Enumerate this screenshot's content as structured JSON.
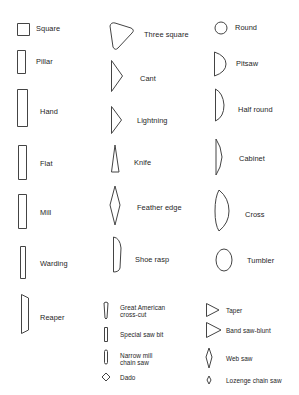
{
  "shapes": {
    "square": {
      "label": "Square",
      "icon": "square-section-icon"
    },
    "pillar": {
      "label": "Pillar",
      "icon": "pillar-section-icon"
    },
    "hand": {
      "label": "Hand",
      "icon": "hand-section-icon"
    },
    "flat": {
      "label": "Flat",
      "icon": "flat-section-icon"
    },
    "mill": {
      "label": "Mill",
      "icon": "mill-section-icon"
    },
    "warding": {
      "label": "Warding",
      "icon": "warding-section-icon"
    },
    "reaper": {
      "label": "Reaper",
      "icon": "reaper-section-icon"
    },
    "three_square": {
      "label": "Three square",
      "icon": "three-square-section-icon"
    },
    "cant": {
      "label": "Cant",
      "icon": "cant-section-icon"
    },
    "lightning": {
      "label": "Lightning",
      "icon": "lightning-section-icon"
    },
    "knife": {
      "label": "Knife",
      "icon": "knife-section-icon"
    },
    "feather_edge": {
      "label": "Feather edge",
      "icon": "feather-edge-section-icon"
    },
    "shoe_rasp": {
      "label": "Shoe rasp",
      "icon": "shoe-rasp-section-icon"
    },
    "great_american": {
      "label_line1": "Great American",
      "label_line2": "cross-cut",
      "icon": "great-american-section-icon"
    },
    "special_saw_bit": {
      "label": "Special saw bit",
      "icon": "special-saw-bit-section-icon"
    },
    "narrow_mill": {
      "label_line1": "Narrow mill",
      "label_line2": "chain saw",
      "icon": "narrow-mill-section-icon"
    },
    "dado": {
      "label": "Dado",
      "icon": "dado-section-icon"
    },
    "round": {
      "label": "Round",
      "icon": "round-section-icon"
    },
    "pitsaw": {
      "label": "Pitsaw",
      "icon": "pitsaw-section-icon"
    },
    "half_round": {
      "label": "Half round",
      "icon": "half-round-section-icon"
    },
    "cabinet": {
      "label": "Cabinet",
      "icon": "cabinet-section-icon"
    },
    "cross": {
      "label": "Cross",
      "icon": "cross-section-icon"
    },
    "tumbler": {
      "label": "Tumbler",
      "icon": "tumbler-section-icon"
    },
    "taper": {
      "label": "Taper",
      "icon": "taper-section-icon"
    },
    "band_saw_blunt": {
      "label": "Band saw-blunt",
      "icon": "band-saw-blunt-section-icon"
    },
    "web_saw": {
      "label": "Web saw",
      "icon": "web-saw-section-icon"
    },
    "lozenge_chain_saw": {
      "label": "Lozenge chain saw",
      "icon": "lozenge-chain-saw-section-icon"
    }
  }
}
